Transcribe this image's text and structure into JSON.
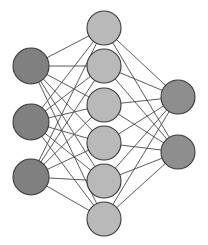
{
  "diagram": {
    "type": "feedforward-neural-network",
    "background_color": "#ffffff",
    "edge_color": "#4a4a4a",
    "edge_width": 0.9,
    "node_stroke_color": "#3a3a3a",
    "node_stroke_width": 1.1,
    "layers": [
      {
        "name": "input-layer",
        "role": "input",
        "node_count": 3,
        "fill_color": "#808080",
        "radius": 18,
        "nodes": [
          {
            "id": "input-1",
            "cx": 31,
            "cy": 66
          },
          {
            "id": "input-2",
            "cx": 31,
            "cy": 122
          },
          {
            "id": "input-3",
            "cx": 31,
            "cy": 177
          }
        ]
      },
      {
        "name": "hidden-layer",
        "role": "hidden",
        "node_count": 6,
        "fill_color": "#b9b9b9",
        "radius": 17,
        "nodes": [
          {
            "id": "hidden-1",
            "cx": 104,
            "cy": 28
          },
          {
            "id": "hidden-2",
            "cx": 104,
            "cy": 66
          },
          {
            "id": "hidden-3",
            "cx": 104,
            "cy": 105
          },
          {
            "id": "hidden-4",
            "cx": 104,
            "cy": 143
          },
          {
            "id": "hidden-5",
            "cx": 104,
            "cy": 181
          },
          {
            "id": "hidden-6",
            "cx": 104,
            "cy": 219
          }
        ]
      },
      {
        "name": "output-layer",
        "role": "output",
        "node_count": 2,
        "fill_color": "#8e8e8e",
        "radius": 17,
        "nodes": [
          {
            "id": "output-1",
            "cx": 178,
            "cy": 97
          },
          {
            "id": "output-2",
            "cx": 178,
            "cy": 152
          }
        ]
      }
    ],
    "connections": [
      {
        "from": "input-1",
        "to": "hidden-1"
      },
      {
        "from": "input-1",
        "to": "hidden-2"
      },
      {
        "from": "input-1",
        "to": "hidden-3"
      },
      {
        "from": "input-1",
        "to": "hidden-4"
      },
      {
        "from": "input-1",
        "to": "hidden-5"
      },
      {
        "from": "input-1",
        "to": "hidden-6"
      },
      {
        "from": "input-2",
        "to": "hidden-1"
      },
      {
        "from": "input-2",
        "to": "hidden-2"
      },
      {
        "from": "input-2",
        "to": "hidden-3"
      },
      {
        "from": "input-2",
        "to": "hidden-4"
      },
      {
        "from": "input-2",
        "to": "hidden-5"
      },
      {
        "from": "input-2",
        "to": "hidden-6"
      },
      {
        "from": "input-3",
        "to": "hidden-1"
      },
      {
        "from": "input-3",
        "to": "hidden-2"
      },
      {
        "from": "input-3",
        "to": "hidden-3"
      },
      {
        "from": "input-3",
        "to": "hidden-4"
      },
      {
        "from": "input-3",
        "to": "hidden-5"
      },
      {
        "from": "input-3",
        "to": "hidden-6"
      },
      {
        "from": "hidden-1",
        "to": "output-1"
      },
      {
        "from": "hidden-1",
        "to": "output-2"
      },
      {
        "from": "hidden-2",
        "to": "output-1"
      },
      {
        "from": "hidden-2",
        "to": "output-2"
      },
      {
        "from": "hidden-3",
        "to": "output-1"
      },
      {
        "from": "hidden-3",
        "to": "output-2"
      },
      {
        "from": "hidden-4",
        "to": "output-1"
      },
      {
        "from": "hidden-4",
        "to": "output-2"
      },
      {
        "from": "hidden-5",
        "to": "output-1"
      },
      {
        "from": "hidden-5",
        "to": "output-2"
      },
      {
        "from": "hidden-6",
        "to": "output-1"
      },
      {
        "from": "hidden-6",
        "to": "output-2"
      }
    ]
  }
}
